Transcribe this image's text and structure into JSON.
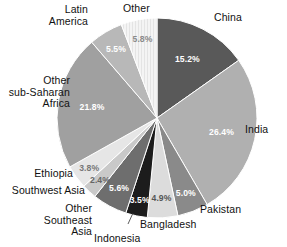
{
  "chart_data": {
    "type": "pie",
    "title": "",
    "subtitle": "",
    "xlabel": "",
    "ylabel": "",
    "legend_position": "none",
    "grid": false,
    "units": "percent",
    "start_angle_deg": 0,
    "direction": "clockwise",
    "center": {
      "x": 157,
      "y": 118
    },
    "radius": 100,
    "categories": [
      "China",
      "India",
      "Pakistan",
      "Bangladesh",
      "Indonesia",
      "Other Southeast Asia",
      "Southwest Asia",
      "Ethiopia",
      "Other sub-Saharan Africa",
      "Latin America",
      "Other"
    ],
    "values": [
      15.2,
      26.4,
      5.0,
      4.9,
      3.5,
      5.6,
      2.4,
      3.8,
      21.8,
      5.5,
      5.8
    ],
    "value_labels": [
      "15.2%",
      "26.4%",
      "5.0%",
      "4.9%",
      "3.5%",
      "5.6%",
      "2.4%",
      "3.8%",
      "21.8%",
      "5.5%",
      "5.8%"
    ],
    "colors": [
      "#595959",
      "#b0b0b0",
      "#8a8a8a",
      "#dcdcdc",
      "#1c1c1c",
      "#6e6e6e",
      "#c9c9c9",
      "#e6e6e6",
      "#a0a0a0",
      "#b8b8b8",
      "#f2f2f2"
    ],
    "label_text_colors": [
      "#ffffff",
      "#ffffff",
      "#ffffff",
      "#555555",
      "#ffffff",
      "#ffffff",
      "#666666",
      "#777777",
      "#ffffff",
      "#ffffff",
      "#8a8a8a"
    ]
  },
  "outside_labels": [
    {
      "name": "China",
      "text": "China",
      "x": 214,
      "y": 12,
      "align": "left"
    },
    {
      "name": "India",
      "text": "India",
      "x": 245,
      "y": 124,
      "align": "left"
    },
    {
      "name": "Pakistan",
      "text": "Pakistan",
      "x": 200,
      "y": 204,
      "align": "left"
    },
    {
      "name": "Bangladesh",
      "text": "Bangladesh",
      "x": 140,
      "y": 219,
      "align": "left"
    },
    {
      "name": "Indonesia",
      "text": "Indonesia",
      "x": 94,
      "y": 233,
      "align": "left"
    },
    {
      "name": "Other Southeast Asia",
      "text": "Other\nSoutheast\nAsia",
      "x": 92,
      "y": 203,
      "align": "right"
    },
    {
      "name": "Southwest Asia",
      "text": "Southwest Asia",
      "x": 85,
      "y": 185,
      "align": "right"
    },
    {
      "name": "Ethiopia",
      "text": "Ethiopia",
      "x": 73,
      "y": 168,
      "align": "right"
    },
    {
      "name": "Other sub-Saharan Africa",
      "text": "Other\nsub-Saharan\nAfrica",
      "x": 70,
      "y": 75,
      "align": "right"
    },
    {
      "name": "Latin America",
      "text": "Latin\nAmerica",
      "x": 88,
      "y": 4,
      "align": "right"
    },
    {
      "name": "Other",
      "text": "Other",
      "x": 123,
      "y": 3,
      "align": "left"
    }
  ],
  "leader_lines": [
    {
      "name": "indonesia-leader",
      "x1": 128,
      "y1": 224,
      "x2": 133,
      "y2": 213
    }
  ]
}
